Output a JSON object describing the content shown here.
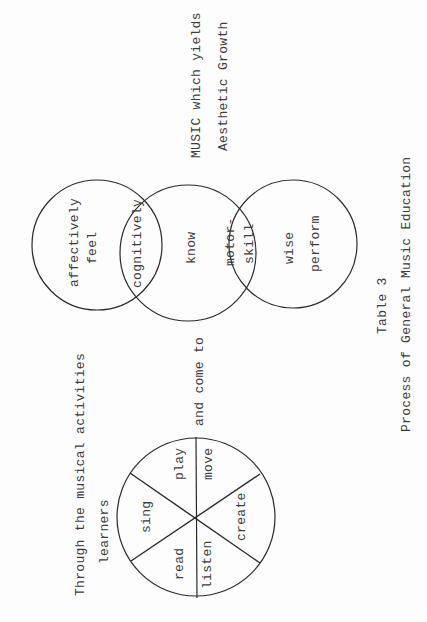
{
  "title": "Process of General Music Education",
  "caption": {
    "table_label": "Table 3",
    "title": "Process of General Music Education"
  },
  "flow_text": {
    "intro_line1": "Through the musical activities",
    "intro_line2": "learners",
    "connector": "and come to",
    "outcome_line1": "MUSIC which yields",
    "outcome_line2": "Aesthetic Growth"
  },
  "activity_wheel": {
    "segments": [
      "play",
      "sing",
      "read",
      "listen",
      "create",
      "move"
    ]
  },
  "venn": {
    "circle1": {
      "line1": "affectively",
      "line2": "feel"
    },
    "overlap12": "cognitively",
    "circle2": "know",
    "overlap23": {
      "line1": "motor-",
      "line2": "skill"
    },
    "circle3": {
      "line1": "wise",
      "line2": "perform"
    }
  },
  "colors": {
    "ink": "#2a2a2a",
    "paper": "#fdfdfd"
  }
}
